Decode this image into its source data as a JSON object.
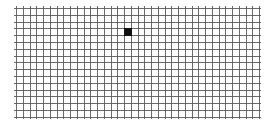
{
  "grid": {
    "origin_x": 16,
    "origin_y": 8,
    "cell_w": 6.75,
    "cell_h": 6.8,
    "cols": 36,
    "rows": 16,
    "overhang": 2,
    "line_color": "#5a5a5a",
    "filled_cells": [
      {
        "col": 16,
        "row": 3,
        "color": "#111111"
      }
    ]
  }
}
